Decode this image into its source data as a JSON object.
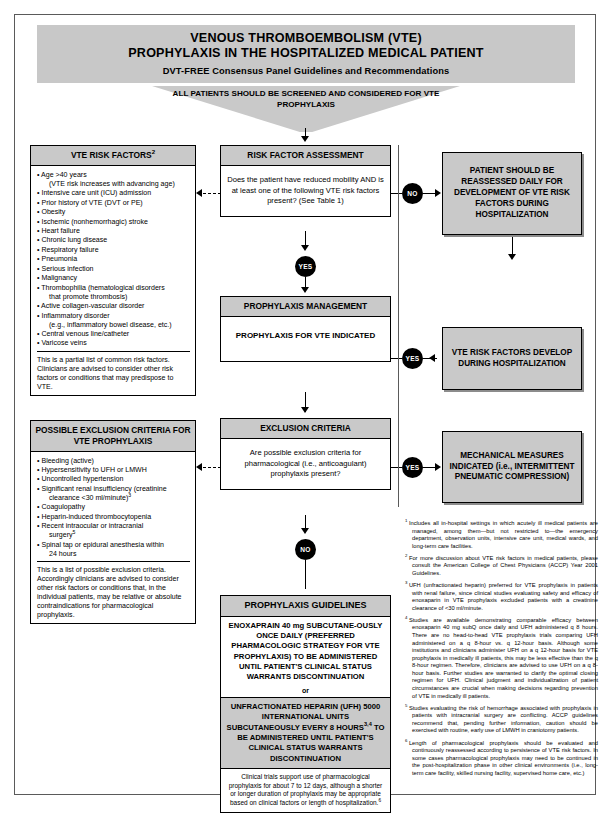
{
  "header": {
    "title_line1": "VENOUS THROMBOEMBOLISM (VTE)",
    "title_line2": "PROPHYLAXIS IN THE HOSPITALIZED MEDICAL PATIENT",
    "subtitle": "DVT-FREE Consensus Panel Guidelines and Recommendations",
    "funnel_text": "ALL PATIENTS SHOULD BE SCREENED AND CONSIDERED FOR VTE PROPHYLAXIS"
  },
  "risk_factors_box": {
    "title": "VTE RISK FACTORS",
    "title_superscript": "2",
    "items": [
      {
        "text": "Age >40 years",
        "sub": "(VTE risk increases with advancing age)"
      },
      {
        "text": "Intensive care unit (ICU) admission"
      },
      {
        "text": "Prior history of VTE (DVT or PE)"
      },
      {
        "text": "Obesity"
      },
      {
        "text": "Ischemic (nonhemorrhagic) stroke"
      },
      {
        "text": "Heart failure"
      },
      {
        "text": "Chronic lung disease"
      },
      {
        "text": "Respiratory failure"
      },
      {
        "text": "Pneumonia"
      },
      {
        "text": "Serious infection"
      },
      {
        "text": "Malignancy"
      },
      {
        "text": "Thrombophilia (hematological disorders",
        "sub": "that promote thrombosis)"
      },
      {
        "text": "Active collagen-vascular disorder"
      },
      {
        "text": "Inflammatory disorder",
        "sub": "(e.g., inflammatory bowel disease, etc.)"
      },
      {
        "text": "Central venous line/catheter"
      },
      {
        "text": "Varicose veins"
      }
    ],
    "note": "This is a partial list of common risk factors. Clinicians are advised to consider other risk factors or conditions that may predispose to VTE."
  },
  "exclusion_box": {
    "title": "POSSIBLE EXCLUSION CRITERIA FOR VTE PROPHYLAXIS",
    "items": [
      {
        "text": "Bleeding (active)"
      },
      {
        "text": "Hypersensitivity to UFH or LMWH"
      },
      {
        "text": "Uncontrolled hypertension"
      },
      {
        "text": "Significant renal insufficiency (creatinine",
        "sub": "clearance <30 ml/minute)",
        "sup": "3"
      },
      {
        "text": "Coagulopathy"
      },
      {
        "text": "Heparin-induced thrombocytopenia"
      },
      {
        "text": "Recent intraocular or intracranial",
        "sub": "surgery",
        "sup": "5"
      },
      {
        "text": "Spinal tap or epidural anesthesia within",
        "sub": "24 hours"
      }
    ],
    "note": "This is a list of possible exclusion criteria. Accordingly clinicians are advised to consider other risk factors or conditions that, in the individual patients, may be relative or absolute contraindications for pharmacological prophylaxis."
  },
  "risk_assessment": {
    "title": "RISK FACTOR ASSESSMENT",
    "question": "Does the patient have reduced mobility AND is at least one of the following VTE risk factors present? (See Table 1)"
  },
  "prophylaxis_management": {
    "title": "PROPHYLAXIS MANAGEMENT",
    "statement": "PROPHYLAXIS FOR VTE INDICATED"
  },
  "exclusion_criteria_decision": {
    "title": "EXCLUSION CRITERIA",
    "question": "Are possible exclusion criteria for pharmacological (i.e., anticoagulant) prophylaxis present?"
  },
  "guidelines_box": {
    "title": "PROPHYLAXIS GUIDELINES",
    "option_a": "ENOXAPRAIN 40 mg SUBCUTANE-OUSLY ONCE DAILY (PREFERRED PHARMACOLOGIC STRATEGY FOR VTE PROPHYLAXIS) TO BE ADMINISTERED UNTIL PATIENT'S CLINICAL STATUS WARRANTS DISCONTINUATION",
    "connector": "or",
    "option_b_pre": "UNFRACTIONATED HEPARIN (UFH) 5000 INTERNATIONAL UNITS SUBCUTANEOUSLY EVERY 8 HOURS",
    "option_b_sup": "3,4",
    "option_b_post": " TO BE ADMINISTERED UNTIL PATIENT'S CLINICAL STATUS WARRANTS DISCONTINUATION",
    "footer_pre": "Clinical trials support use of pharmacological prophylaxis for about 7 to 12 days, although a shorter or longer duration of prophylaxis may be appropriate based on clinical factors or length of hospitalization.",
    "footer_sup": "6"
  },
  "right_boxes": {
    "reassess": "PATIENT SHOULD BE REASSESSED DAILY FOR DEVELOPMENT OF VTE RISK FACTORS DURING HOSPITALIZATION",
    "develop": "VTE RISK FACTORS DEVELOP DURING HOSPITALIZATION",
    "mechanical": "MECHANICAL MEASURES INDICATED (i.e., INTERMITTENT PNEUMATIC COMPRESSION)"
  },
  "nodes": {
    "no_1": "NO",
    "yes_1": "YES",
    "yes_2": "YES",
    "yes_3": "YES",
    "no_2": "NO"
  },
  "footnotes": [
    {
      "marker": "1",
      "text": "Includes all in-hospital settings in which acutely ill medical patients are managed, among them—but not restricted to—the emergency department, observation units, intensive care unit, medical wards, and long-term care facilities."
    },
    {
      "marker": "2",
      "text": "For more discussion about VTE risk factors in medical patients, please consult the American College of Chest Physicians (ACCP) Year 2001 Guidelines."
    },
    {
      "marker": "3",
      "text": "UFH (unfractionated heparin) preferred for VTE prophylaxis in patients with renal failure, since clinical studies evaluating safety and efficacy of enoxaparin in VTE prophylaxis excluded patients with a creatinine clearance of <30 ml/minute."
    },
    {
      "marker": "4",
      "text": "Studies are available demonstrating comparable efficacy between enoxaparin 40 mg subQ once daily and UFH administered q 8 hours. There are no head-to-head VTE prophylaxis trials comparing UFH administered on a q 8-hour vs. q 12-hour basis. Although some institutions and clinicians administer UFH on a q 12-hour basis for VTE prophylaxis in medically ill patients, this may be less effective than the q 8-hour regimen. Therefore, clinicians are advised to use UFH on a q 8-hour basis. Further studies are warranted to clarify the optimal closing regimen for UFH. Clinical judgment and individualization of patient circumstances are crucial when making decisions regarding prevention of VTE in medically ill patients."
    },
    {
      "marker": "5",
      "text": "Studies evaluating the risk of hemorrhage associated with prophylaxis in patients with intracranial surgery are conflicting. ACCP guidelines recommend that, pending further information, caution should be exercised with routine, early use of LMWH in craniotomy patients."
    },
    {
      "marker": "6",
      "text": "Length of pharmacological prophylaxis should be evaluated and continuously reassessed according to persistence of VTE risk factors. In some cases pharmacological prophylaxis may need to be continued in the post-hospitalization phase in other clinical environments (i.e., long-term care facility, skilled nursing facility, supervised home care, etc.)"
    }
  ]
}
